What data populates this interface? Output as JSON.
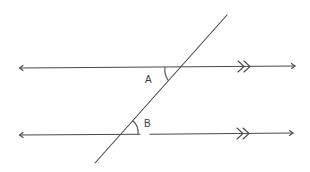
{
  "diagram": {
    "type": "parallel-lines-transversal",
    "line_color": "#4a4a4a",
    "labels": {
      "angle_a": "A",
      "angle_b": "B"
    },
    "parallel_marker": "double-chevron",
    "lines": [
      {
        "name": "top-parallel-line",
        "y": 67,
        "x_start": 20,
        "x_end": 295
      },
      {
        "name": "bottom-parallel-line",
        "y": 134,
        "x_start": 20,
        "x_end": 293
      },
      {
        "name": "transversal",
        "from": [
          227,
          15
        ],
        "to": [
          95,
          163
        ]
      }
    ],
    "angles": [
      {
        "name": "A",
        "vertex": [
          181,
          67
        ],
        "description": "interior angle below top line, left of transversal"
      },
      {
        "name": "B",
        "vertex": [
          121,
          134
        ],
        "description": "interior angle above bottom line, right of transversal"
      }
    ]
  }
}
